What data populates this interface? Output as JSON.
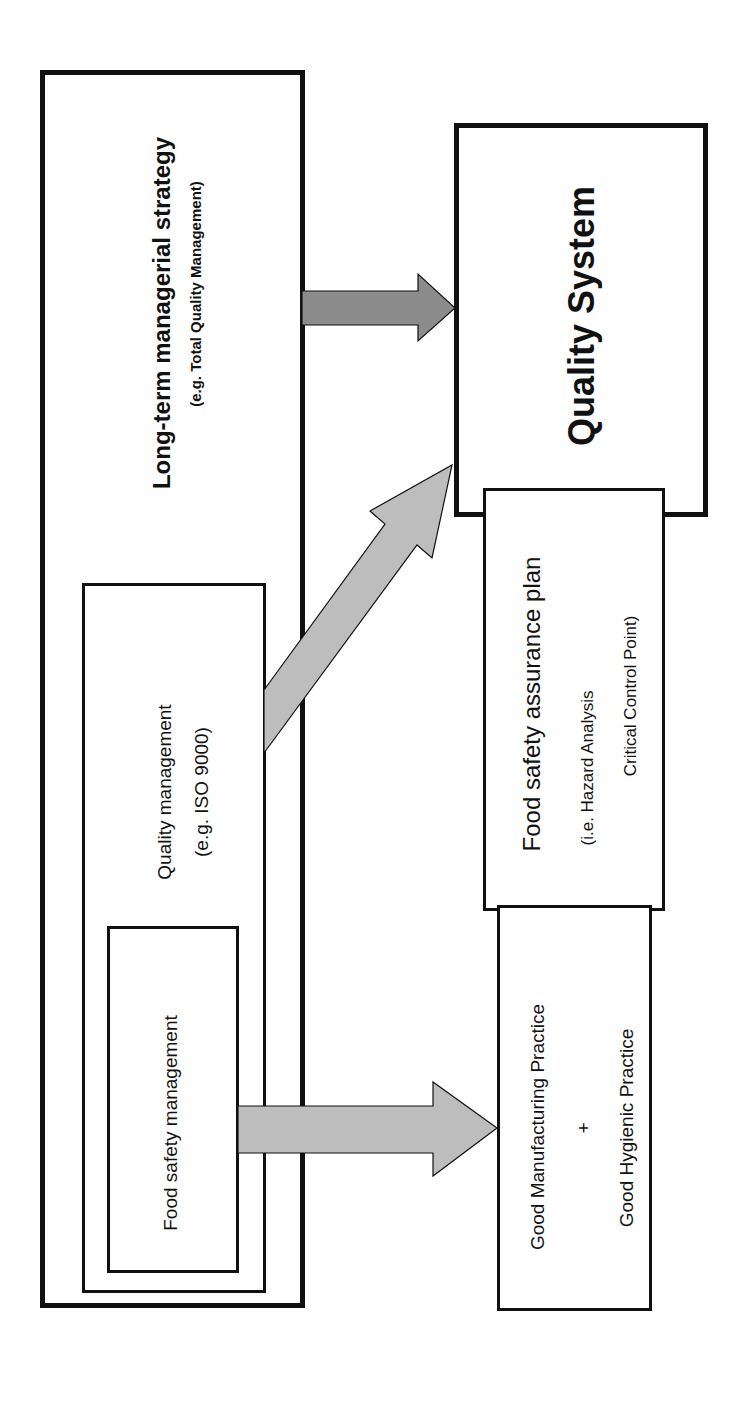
{
  "diagram": {
    "left_group": {
      "outer_box": {
        "title": "Long-term managerial strategy",
        "subtitle": "(e.g. Total Quality Management)"
      },
      "middle_box": {
        "title": "Quality management",
        "subtitle": "(e.g. ISO 9000)"
      },
      "inner_box": {
        "title": "Food safety management"
      }
    },
    "right_group": {
      "quality_system": {
        "title": "Quality System"
      },
      "food_safety_assurance_plan": {
        "title": "Food safety assurance plan",
        "line1": "(i.e. Hazard Analysis",
        "line2": "Critical Control Point)"
      },
      "good_practices": {
        "line1": "Good Manufacturing Practice",
        "plus": "+",
        "line2": "Good Hygienic Practice"
      }
    },
    "arrows": [
      {
        "from": "Long-term managerial strategy",
        "to": "Quality System",
        "color": "#8c8c8c"
      },
      {
        "from": "Quality management",
        "to": "Quality System",
        "color": "#bdbdbd"
      },
      {
        "from": "Food safety management",
        "to": "Good Manufacturing Practice + Good Hygienic Practice",
        "color": "#bdbdbd"
      }
    ],
    "colors": {
      "border": "#111111",
      "dark_arrow": "#8c8c8c",
      "light_arrow": "#bdbdbd",
      "background": "#ffffff"
    }
  }
}
